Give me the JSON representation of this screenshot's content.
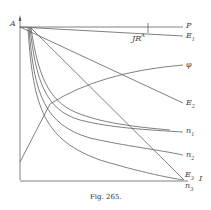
{
  "figure": {
    "caption": "Fig. 265.",
    "origin_label": "A",
    "labels": {
      "P": "P",
      "E1": "E",
      "E1_sub": "1",
      "IR": "JR",
      "IR_sup": "A",
      "phi": "φ",
      "E2": "E",
      "E2_sub": "2",
      "n1": "n",
      "n1_sub": "1",
      "n2": "n",
      "n2_sub": "2",
      "E3": "E",
      "E3_sub": "3",
      "n3": "n",
      "n3_sub": "3",
      "I": "I"
    },
    "colors": {
      "line": "#555555",
      "text": "#444444"
    }
  }
}
